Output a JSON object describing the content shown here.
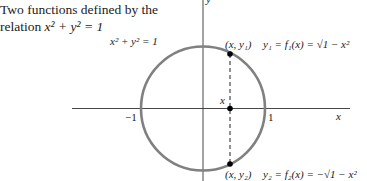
{
  "caption": {
    "line1": "Two functions defined by the",
    "line2_prefix": "relation ",
    "line2_math": "x² + y² = 1"
  },
  "figure": {
    "circle_label": "x² + y² = 1",
    "axis_x_label": "x",
    "axis_y_label": "y",
    "tick_neg1": "−1",
    "tick_pos1": "1",
    "point_x_label": "x",
    "upper_point_label": "(x, y₁)",
    "upper_function": "y₁ = f₁(x) = √1 − x²",
    "lower_point_label": "(x, y₂)",
    "lower_function": "y₂ = f₂(x) = −√1 − x²",
    "colors": {
      "circle": "#808080",
      "axes": "#333333",
      "points": "#000000"
    }
  }
}
